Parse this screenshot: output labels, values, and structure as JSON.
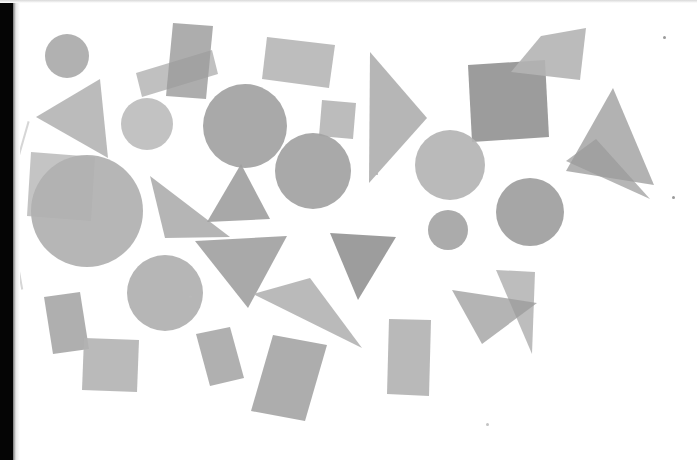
{
  "canvas": {
    "width": 697,
    "height": 460,
    "background_color": "#ffffff",
    "title": "Scanned sheet of translucent geometric shapes"
  },
  "palette": {
    "light_gray": "#bfbfbf",
    "mid_gray": "#aaaaaa",
    "dark_gray": "#999999",
    "darker_gray": "#8c8c8c",
    "overlap_gray": "#7d7d7d",
    "scan_edge_black": "#050505"
  },
  "artifacts": {
    "left_edge_label": "scan-edge-black-strip",
    "specks": [
      {
        "name": "speck-top-right",
        "x": 663,
        "y": 36,
        "size": 3,
        "color": "#9a9a9a"
      },
      {
        "name": "speck-right-mid",
        "x": 672,
        "y": 196,
        "size": 3,
        "color": "#9a9a9a"
      },
      {
        "name": "speck-center",
        "x": 189,
        "y": 295,
        "size": 3,
        "color": "#b8b8b8"
      },
      {
        "name": "speck-bottom",
        "x": 486,
        "y": 423,
        "size": 3,
        "color": "#c3c3c3"
      },
      {
        "name": "speck-mid-right",
        "x": 376,
        "y": 173,
        "size": 2,
        "color": "#b0b0b0"
      }
    ]
  },
  "shapes": [
    {
      "id": 1,
      "name": "circle-top-left-small",
      "type": "circle",
      "cx": 67,
      "cy": 56,
      "r": 22,
      "color": "#aaaaaa",
      "opacity": 0.92
    },
    {
      "id": 2,
      "name": "triangle-upper-left",
      "type": "polygon",
      "points": "36,117 100,79 108,158",
      "color": "#b5b5b5",
      "opacity": 0.92
    },
    {
      "id": 3,
      "name": "rectangle-upper-left-wide",
      "type": "polygon",
      "points": "136,73 212,50 218,74 142,97",
      "color": "#b9b9b9",
      "opacity": 0.9
    },
    {
      "id": 4,
      "name": "rectangle-top-vertical",
      "type": "polygon",
      "points": "173,23 213,26 206,99 166,96",
      "color": "#9b9b9b",
      "opacity": 0.82
    },
    {
      "id": 5,
      "name": "circle-upper-left-mid",
      "type": "circle",
      "cx": 147,
      "cy": 124,
      "r": 26,
      "color": "#bdbdbd",
      "opacity": 0.92
    },
    {
      "id": 6,
      "name": "circle-center-upper",
      "type": "circle",
      "cx": 245,
      "cy": 126,
      "r": 42,
      "color": "#a2a2a2",
      "opacity": 0.93
    },
    {
      "id": 7,
      "name": "rectangle-top-center",
      "type": "polygon",
      "points": "267,37 335,45 329,88 262,79",
      "color": "#b6b6b6",
      "opacity": 0.9
    },
    {
      "id": 8,
      "name": "square-center-small",
      "type": "polygon",
      "points": "322,100 356,103 353,139 319,136",
      "color": "#b5b5b5",
      "opacity": 0.9
    },
    {
      "id": 9,
      "name": "triangle-center-tall",
      "type": "polygon",
      "points": "370,52 427,118 369,183",
      "color": "#aeaeae",
      "opacity": 0.9
    },
    {
      "id": 10,
      "name": "circle-center",
      "type": "circle",
      "cx": 313,
      "cy": 171,
      "r": 38,
      "color": "#a3a3a3",
      "opacity": 0.93
    },
    {
      "id": 11,
      "name": "square-upper-right-dark",
      "type": "polygon",
      "points": "468,65 545,60 549,137 472,142",
      "color": "#8e8e8e",
      "opacity": 0.88
    },
    {
      "id": 12,
      "name": "triangle-top-right-small",
      "type": "polygon",
      "points": "541,36 586,28 580,80 511,72",
      "color": "#b4b4b4",
      "opacity": 0.9
    },
    {
      "id": 13,
      "name": "triangle-right-large",
      "type": "polygon",
      "points": "613,88 654,185 566,171",
      "color": "#aaaaaa",
      "opacity": 0.9
    },
    {
      "id": 14,
      "name": "triangle-right-overlap",
      "type": "polygon",
      "points": "596,139 650,199 566,161",
      "color": "#9a9a9a",
      "opacity": 0.72
    },
    {
      "id": 15,
      "name": "circle-right-light",
      "type": "circle",
      "cx": 450,
      "cy": 165,
      "r": 35,
      "color": "#b4b4b4",
      "opacity": 0.92
    },
    {
      "id": 16,
      "name": "circle-right-small",
      "type": "circle",
      "cx": 448,
      "cy": 230,
      "r": 20,
      "color": "#a4a4a4",
      "opacity": 0.92
    },
    {
      "id": 17,
      "name": "circle-right-dark",
      "type": "circle",
      "cx": 530,
      "cy": 212,
      "r": 34,
      "color": "#9e9e9e",
      "opacity": 0.92
    },
    {
      "id": 18,
      "name": "square-left-rotated-dark",
      "type": "polygon",
      "points": "31,152 95,157 91,221 27,216",
      "color": "#a0a0a0",
      "opacity": 0.62
    },
    {
      "id": 19,
      "name": "circle-left-large",
      "type": "circle",
      "cx": 87,
      "cy": 211,
      "r": 56,
      "color": "#b0b0b0",
      "opacity": 0.92
    },
    {
      "id": 20,
      "name": "triangle-left-right-angle",
      "type": "polygon",
      "points": "150,176 165,238 230,237",
      "color": "#adadad",
      "opacity": 0.9
    },
    {
      "id": 21,
      "name": "triangle-mid-pointing",
      "type": "polygon",
      "points": "241,164 270,219 207,222",
      "color": "#9f9f9f",
      "opacity": 0.9
    },
    {
      "id": 22,
      "name": "triangle-center-wide",
      "type": "polygon",
      "points": "195,241 287,236 248,308",
      "color": "#a0a0a0",
      "opacity": 0.9
    },
    {
      "id": 23,
      "name": "triangle-center-dark",
      "type": "polygon",
      "points": "330,233 396,237 358,300",
      "color": "#929292",
      "opacity": 0.9
    },
    {
      "id": 24,
      "name": "triangle-thin-sliver",
      "type": "polygon",
      "points": "253,294 310,278 362,348",
      "color": "#b3b3b3",
      "opacity": 0.9
    },
    {
      "id": 25,
      "name": "circle-lower-left",
      "type": "circle",
      "cx": 165,
      "cy": 293,
      "r": 38,
      "color": "#b0b0b0",
      "opacity": 0.92
    },
    {
      "id": 26,
      "name": "rectangle-bottom-left-rot",
      "type": "polygon",
      "points": "44,297 80,292 89,349 53,354",
      "color": "#a6a6a6",
      "opacity": 0.9
    },
    {
      "id": 27,
      "name": "square-bottom-left",
      "type": "polygon",
      "points": "84,338 139,340 137,392 82,390",
      "color": "#b2b2b2",
      "opacity": 0.9
    },
    {
      "id": 28,
      "name": "rectangle-bottom-center-1",
      "type": "polygon",
      "points": "196,334 230,327 244,378 210,386",
      "color": "#a7a7a7",
      "opacity": 0.9
    },
    {
      "id": 29,
      "name": "rectangle-bottom-center-2",
      "type": "polygon",
      "points": "273,335 327,345 305,421 251,411",
      "color": "#a4a4a4",
      "opacity": 0.9
    },
    {
      "id": 30,
      "name": "rectangle-bottom-right",
      "type": "polygon",
      "points": "389,319 431,320 429,396 387,394",
      "color": "#b1b1b1",
      "opacity": 0.9
    },
    {
      "id": 31,
      "name": "triangle-lowright-light",
      "type": "polygon",
      "points": "496,270 535,272 532,354",
      "color": "#b4b4b4",
      "opacity": 0.88
    },
    {
      "id": 32,
      "name": "triangle-lowright-dark",
      "type": "polygon",
      "points": "452,290 537,303 482,344",
      "color": "#9b9b9b",
      "opacity": 0.75
    }
  ]
}
